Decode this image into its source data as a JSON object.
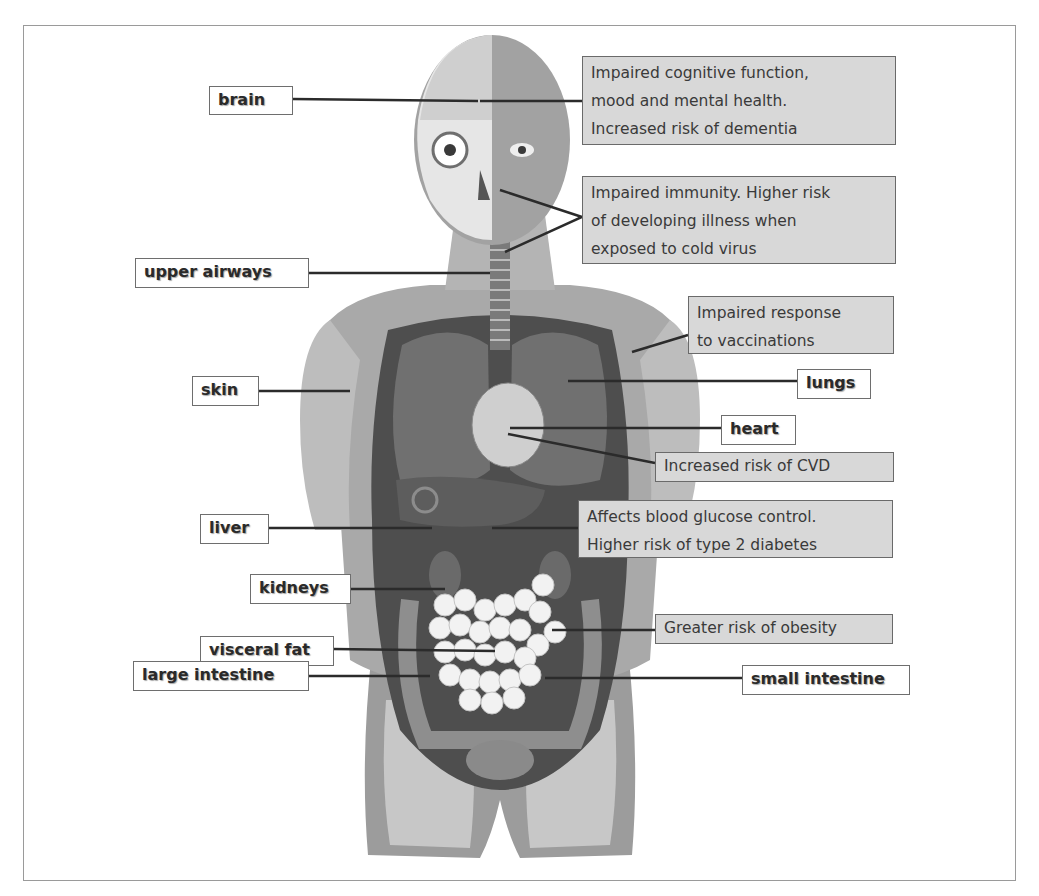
{
  "colors": {
    "frame_border": "#9a9a9a",
    "label_border": "#6e6e6e",
    "effect_fill": "#d8d8d8",
    "effect_border": "#6a6a6a",
    "leader_line": "#2b2b2b"
  },
  "organ_labels": [
    {
      "id": "brain",
      "text": "brain"
    },
    {
      "id": "upper-airways",
      "text": "upper airways"
    },
    {
      "id": "skin",
      "text": "skin"
    },
    {
      "id": "lungs",
      "text": "lungs"
    },
    {
      "id": "heart",
      "text": "heart"
    },
    {
      "id": "liver",
      "text": "liver"
    },
    {
      "id": "kidneys",
      "text": "kidneys"
    },
    {
      "id": "visceral-fat",
      "text": "visceral fat"
    },
    {
      "id": "large-intestine",
      "text": "large intestine"
    },
    {
      "id": "small-intestine",
      "text": "small intestine"
    }
  ],
  "effects": [
    {
      "id": "cognitive",
      "text": "Impaired cognitive function,\nmood and mental health.\nIncreased  risk of dementia"
    },
    {
      "id": "immunity",
      "text": "Impaired immunity. Higher risk\nof developing illness when\nexposed to cold virus"
    },
    {
      "id": "vaccination",
      "text": "Impaired response\nto vaccinations"
    },
    {
      "id": "cvd",
      "text": "Increased  risk of CVD"
    },
    {
      "id": "glucose",
      "text": "Affects  blood glucose control.\nHigher risk of type 2 diabetes"
    },
    {
      "id": "obesity",
      "text": "Greater  risk of obesity"
    }
  ]
}
